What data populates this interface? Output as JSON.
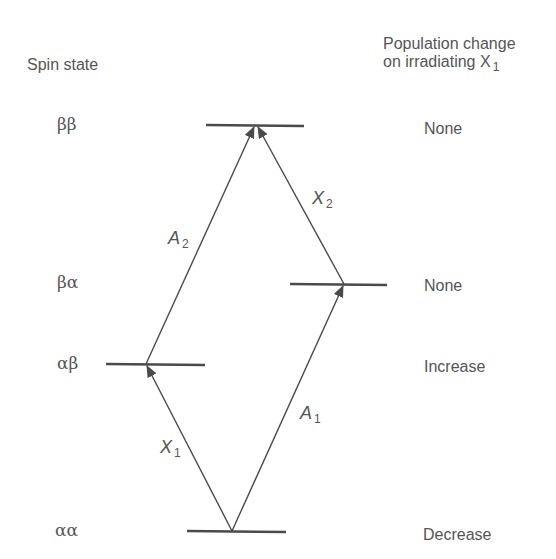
{
  "headers": {
    "left": "Spin state",
    "right_line1": "Population change",
    "right_line2_prefix": "on irradiating X",
    "right_line2_sub": "1"
  },
  "levels": [
    {
      "state": "ββ",
      "population_change": "None"
    },
    {
      "state": "βα",
      "population_change": "None"
    },
    {
      "state": "αβ",
      "population_change": "Increase"
    },
    {
      "state": "αα",
      "population_change": "Decrease"
    }
  ],
  "transitions": [
    {
      "name": "X",
      "sub": "1",
      "from": "αα",
      "to": "αβ"
    },
    {
      "name": "A",
      "sub": "1",
      "from": "αα",
      "to": "βα"
    },
    {
      "name": "A",
      "sub": "2",
      "from": "αβ",
      "to": "ββ"
    },
    {
      "name": "X",
      "sub": "2",
      "from": "βα",
      "to": "ββ"
    }
  ],
  "colors": {
    "line": "#4a4a4a",
    "text": "#555555"
  }
}
